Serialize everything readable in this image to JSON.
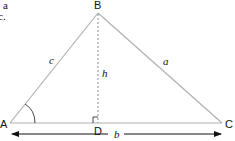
{
  "fragment_text": [
    "a",
    "c."
  ],
  "vertices": {
    "A": {
      "label": "A",
      "x": 10,
      "y": 123
    },
    "B": {
      "label": "B",
      "x": 98,
      "y": 13
    },
    "C": {
      "label": "C",
      "x": 222,
      "y": 123
    },
    "D": {
      "label": "D",
      "x": 98,
      "y": 123
    }
  },
  "sides": {
    "a": "a",
    "b": "b",
    "c": "c",
    "h": "h"
  },
  "colors": {
    "triangle_stroke": "#b0b0b0",
    "text": "#111111",
    "arrow": "#111111"
  }
}
